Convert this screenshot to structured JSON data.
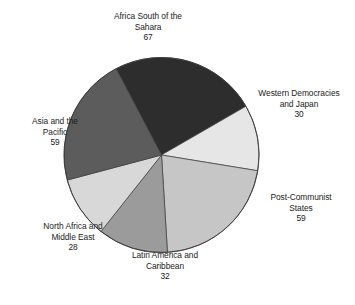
{
  "chart_data": {
    "type": "pie",
    "title": "",
    "subtitle": "",
    "xlabel": "",
    "ylabel": "",
    "legend_position": "none",
    "grid": false,
    "total": 275,
    "units": "countries",
    "categories": [
      "Africa South of the Sahara",
      "Western Democracies and Japan",
      "Post-Communist States",
      "Latin America and Caribbean",
      "North Africa and Middle East",
      "Asia and the Pacific"
    ],
    "values": [
      67,
      30,
      59,
      32,
      28,
      59
    ],
    "colors": [
      "#2d2d2d",
      "#e6e6e6",
      "#c6c6c6",
      "#9b9b9b",
      "#d8d8d8",
      "#5c5c5c"
    ],
    "slices": [
      {
        "label": "Africa South of the Sahara",
        "label_line1": "Africa South of the",
        "label_line2": "Sahara",
        "value": 67,
        "value_text": "67",
        "color": "#2d2d2d",
        "start_angle": 332.3,
        "end_angle": 60.0
      },
      {
        "label": "Western Democracies and Japan",
        "label_line1": "Western Democracies",
        "label_line2": "and Japan",
        "value": 30,
        "value_text": "30",
        "color": "#e6e6e6",
        "start_angle": 60.0,
        "end_angle": 99.3
      },
      {
        "label": "Post-Communist States",
        "label_line1": "Post-Communist",
        "label_line2": "States",
        "value": 59,
        "value_text": "59",
        "color": "#c6c6c6",
        "start_angle": 99.3,
        "end_angle": 176.5
      },
      {
        "label": "Latin America and Caribbean",
        "label_line1": "Latin America and",
        "label_line2": "Caribbean",
        "value": 32,
        "value_text": "32",
        "color": "#9b9b9b",
        "start_angle": 176.5,
        "end_angle": 218.4
      },
      {
        "label": "North Africa and Middle East",
        "label_line1": "North Africa and",
        "label_line2": "Middle East",
        "value": 28,
        "value_text": "28",
        "color": "#d8d8d8",
        "start_angle": 218.4,
        "end_angle": 255.1
      },
      {
        "label": "Asia and the Pacific",
        "label_line1": "Asia and the",
        "label_line2": "Pacific",
        "value": 59,
        "value_text": "59",
        "color": "#5c5c5c",
        "start_angle": 255.1,
        "end_angle": 332.3
      }
    ],
    "geometry": {
      "center_x": 161.5,
      "center_y": 155,
      "radius": 97.5
    },
    "style": {
      "background": "#ffffff",
      "outline": "#3a3a3a",
      "text": "#1b1b1b"
    }
  }
}
